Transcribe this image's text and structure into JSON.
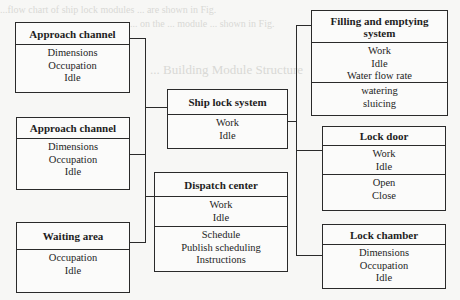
{
  "diagram": {
    "type": "module structure diagram",
    "background_text": [
      "...flow chart of ship lock modules ... are shown in Fig.",
      "... on the ... module ... shown in Fig.",
      "... Building Module Structure",
      "... lock system, following",
      "... the system ..."
    ],
    "boxes": {
      "approach_channel_1": {
        "title": "Approach channel",
        "sections": [
          [
            "Dimensions",
            "Occupation",
            "Idle"
          ]
        ]
      },
      "approach_channel_2": {
        "title": "Approach channel",
        "sections": [
          [
            "Dimensions",
            "Occupation",
            "Idle"
          ]
        ]
      },
      "waiting_area": {
        "title": "Waiting area",
        "sections": [
          [
            "Occupation",
            "Idle"
          ]
        ]
      },
      "ship_lock_system": {
        "title": "Ship lock system",
        "sections": [
          [
            "Work",
            "Idle"
          ]
        ]
      },
      "dispatch_center": {
        "title": "Dispatch center",
        "sections": [
          [
            "Work",
            "Idle"
          ],
          [
            "Schedule",
            "Publish scheduling",
            "Instructions"
          ]
        ]
      },
      "filling_emptying": {
        "title": "Filling and emptying system",
        "title_lines": [
          "Filling and emptying",
          "system"
        ],
        "sections": [
          [
            "Work",
            "Idle",
            "Water flow rate"
          ],
          [
            "watering",
            "sluicing"
          ]
        ]
      },
      "lock_door": {
        "title": "Lock door",
        "sections": [
          [
            "Work",
            "Idle"
          ],
          [
            "Open",
            "Close"
          ]
        ]
      },
      "lock_chamber": {
        "title": "Lock chamber",
        "sections": [
          [
            "Dimensions",
            "Occupation",
            "Idle"
          ]
        ]
      }
    },
    "connections": [
      [
        "approach_channel_1",
        "ship_lock_system"
      ],
      [
        "approach_channel_2",
        "ship_lock_system"
      ],
      [
        "waiting_area",
        "ship_lock_system"
      ],
      [
        "dispatch_center",
        "ship_lock_system"
      ],
      [
        "ship_lock_system",
        "filling_emptying"
      ],
      [
        "ship_lock_system",
        "lock_door"
      ],
      [
        "ship_lock_system",
        "lock_chamber"
      ]
    ]
  }
}
